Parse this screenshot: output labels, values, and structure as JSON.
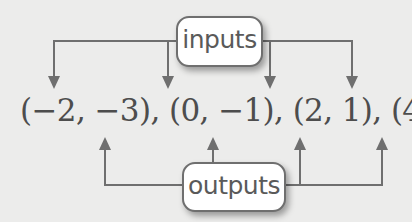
{
  "diagram": {
    "inputs_label": "inputs",
    "outputs_label": "outputs",
    "ordered_pairs_text": "(−2, −3), (0, −1), (2, 1), (4, 3)",
    "ordered_pairs": [
      {
        "x": -2,
        "y": -3
      },
      {
        "x": 0,
        "y": -1
      },
      {
        "x": 2,
        "y": 1
      },
      {
        "x": 4,
        "y": 3
      }
    ],
    "colors": {
      "background": "#ececeb",
      "line": "#6f6f6f",
      "text": "#4d4d4d",
      "box_fill": "#ffffff"
    }
  }
}
